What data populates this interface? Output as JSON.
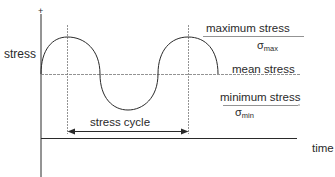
{
  "diagram": {
    "y_axis_plus": "+",
    "y_label": "stress",
    "x_label": "time",
    "labels": {
      "max_stress": "maximum stress",
      "max_symbol": "σ",
      "max_sub": "max",
      "mean_stress": "mean stress",
      "min_stress": "minimum stress",
      "min_symbol": "σ",
      "min_sub": "min",
      "cycle": "stress cycle"
    },
    "colors": {
      "line": "#2a2a2a",
      "guide": "#777777"
    }
  }
}
